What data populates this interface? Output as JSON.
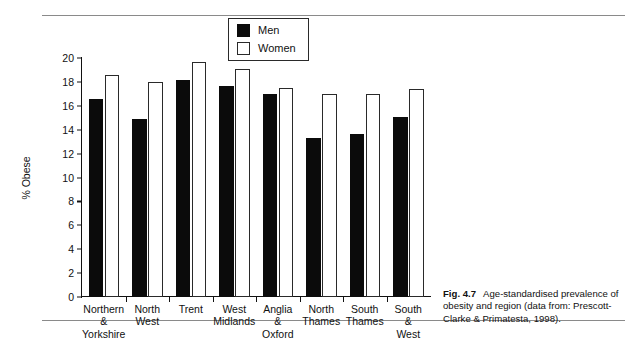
{
  "figure": {
    "caption_number": "Fig. 4.7",
    "caption_text": "Age-standardised prevalence of obesity and region (data from: Prescott-Clarke & Primatesta, 1998)."
  },
  "legend": {
    "position": "top-center",
    "entries": [
      {
        "label": "Men",
        "swatch": "filled-black-square"
      },
      {
        "label": "Women",
        "swatch": "open-white-square"
      }
    ]
  },
  "axis": {
    "y_title": "% Obese",
    "y_ticks": [
      "0",
      "2",
      "4",
      "6",
      "8",
      "10",
      "12",
      "14",
      "16",
      "18",
      "20"
    ]
  },
  "colors": {
    "men": "#0b0b0b",
    "women": "#ffffff",
    "women_outline": "#2a2a2a",
    "axis": "#111111",
    "rule": "#8a8a8a"
  },
  "chart_data": {
    "type": "bar",
    "title": "",
    "subtitle": "",
    "xlabel": "",
    "ylabel": "% Obese",
    "ylim": [
      0,
      20
    ],
    "ytick_step": 2,
    "grid": false,
    "legend_position": "top-center",
    "categories": [
      "Northern\n&\nYorkshire",
      "North\nWest",
      "Trent",
      "West\nMidlands",
      "Anglia\n&\nOxford",
      "North\nThames",
      "South\nThames",
      "South\n&\nWest"
    ],
    "category_labels_flat": [
      "Northern & Yorkshire",
      "North West",
      "Trent",
      "West Midlands",
      "Anglia & Oxford",
      "North Thames",
      "South Thames",
      "South & West"
    ],
    "series": [
      {
        "name": "Men",
        "values": [
          16.6,
          14.9,
          18.2,
          17.7,
          17.0,
          13.3,
          13.6,
          15.1
        ]
      },
      {
        "name": "Women",
        "values": [
          18.6,
          18.0,
          19.7,
          19.1,
          17.5,
          17.0,
          17.0,
          17.4
        ]
      }
    ]
  }
}
